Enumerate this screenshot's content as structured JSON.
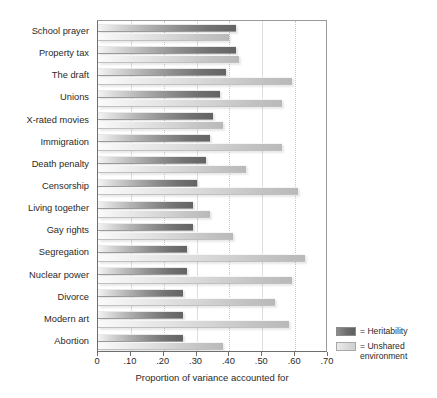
{
  "chart_data": {
    "type": "bar",
    "orientation": "horizontal",
    "title": "",
    "xlabel": "Proportion of variance accounted for",
    "ylabel": "",
    "xlim": [
      0,
      0.7
    ],
    "xticks": [
      0,
      0.1,
      0.2,
      0.3,
      0.4,
      0.5,
      0.6,
      0.7
    ],
    "xticklabels": [
      "0",
      ".10",
      ".20",
      ".30",
      ".40",
      ".50",
      ".60",
      ".70"
    ],
    "grid": "vertical-light",
    "legend_position": "outside-right-bottom",
    "categories": [
      "School prayer",
      "Property tax",
      "The draft",
      "Unions",
      "X-rated movies",
      "Immigration",
      "Death penalty",
      "Censorship",
      "Living together",
      "Gay rights",
      "Segregation",
      "Nuclear power",
      "Divorce",
      "Modern art",
      "Abortion"
    ],
    "series": [
      {
        "name": "Heritability",
        "color": "#6b6b6b",
        "values": [
          0.42,
          0.42,
          0.39,
          0.37,
          0.35,
          0.34,
          0.33,
          0.3,
          0.29,
          0.29,
          0.27,
          0.27,
          0.26,
          0.26,
          0.26
        ]
      },
      {
        "name": "Unshared environment",
        "color": "#d4d4d4",
        "values": [
          0.4,
          0.43,
          0.59,
          0.56,
          0.38,
          0.56,
          0.45,
          0.61,
          0.34,
          0.41,
          0.63,
          0.59,
          0.54,
          0.58,
          0.38
        ]
      }
    ]
  },
  "legend": {
    "entries": [
      {
        "label": "= Heritability",
        "swatch": "dark"
      },
      {
        "label": "= Unshared environment",
        "swatch": "light"
      }
    ]
  }
}
